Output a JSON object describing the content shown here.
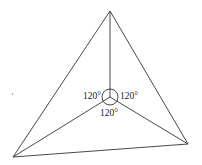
{
  "diagram": {
    "type": "triangle-fermat-point",
    "colors": {
      "line": "#333333",
      "text": "#222222",
      "background": "#ffffff"
    },
    "vertices": {
      "top": {
        "x": 110,
        "y": 11
      },
      "bottom_left": {
        "x": 13,
        "y": 157
      },
      "bottom_right": {
        "x": 188,
        "y": 144
      }
    },
    "center": {
      "x": 110,
      "y": 97
    },
    "angle_circle_radius": 8,
    "angle_labels": {
      "left": "120°",
      "right": "120°",
      "bottom": "120°"
    }
  }
}
